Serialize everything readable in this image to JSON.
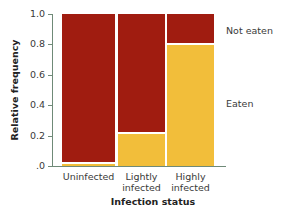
{
  "chart_data": {
    "type": "bar",
    "subtype": "stacked-mosaic",
    "title": "",
    "xlabel": "Infection status",
    "ylabel": "Relative frequency",
    "ylim": [
      0,
      1.0
    ],
    "yticks": [
      "1.0",
      "0.8",
      "0.6",
      "0.4",
      "0.2",
      ".0"
    ],
    "grid": false,
    "legend_position": "right (direct labels)",
    "categories": [
      "Uninfected",
      "Lightly infected",
      "Highly infected"
    ],
    "category_labels": [
      {
        "line1": "Uninfected",
        "line2": ""
      },
      {
        "line1": "Lightly",
        "line2": "infected"
      },
      {
        "line1": "Highly",
        "line2": "infected"
      }
    ],
    "series": [
      {
        "name": "Eaten",
        "color": "#f2be3a",
        "values": [
          0.02,
          0.22,
          0.8
        ]
      },
      {
        "name": "Not eaten",
        "color": "#a01c10",
        "values": [
          0.98,
          0.78,
          0.2
        ]
      }
    ],
    "bar_widths_relative": [
      1.1,
      1.0,
      1.0
    ]
  },
  "legend": {
    "not_eaten": "Not eaten",
    "eaten": "Eaten"
  }
}
